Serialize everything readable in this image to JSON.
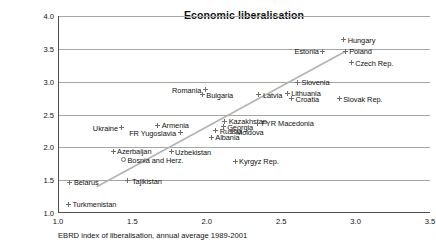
{
  "chart_data": {
    "type": "scatter",
    "title": "Economic liberalisation",
    "xlabel": "EBRD index of liberalisation, annual average 1989-2001",
    "ylabel": "",
    "xlim": [
      1.0,
      3.5
    ],
    "ylim": [
      1.0,
      4.0
    ],
    "xticks": [
      "1.0",
      "1.5",
      "2.0",
      "2.5",
      "3.0",
      "3.5"
    ],
    "yticks": [
      "1.0",
      "1.5",
      "2.0",
      "2.5",
      "3.0",
      "3.5",
      "4.0"
    ],
    "grid": "horizontal",
    "legend": "none",
    "trendline": {
      "x0": 1.26,
      "y0": 1.4,
      "x1": 2.93,
      "y1": 3.46
    },
    "points": [
      {
        "name": "Hungary",
        "x": 2.92,
        "y": 3.64,
        "label_side": "right"
      },
      {
        "name": "Estonia",
        "x": 2.78,
        "y": 3.46,
        "label_side": "left"
      },
      {
        "name": "Poland",
        "x": 2.93,
        "y": 3.46,
        "label_side": "right"
      },
      {
        "name": "Czech Rep.",
        "x": 2.97,
        "y": 3.29,
        "label_side": "right"
      },
      {
        "name": "Slovenia",
        "x": 2.61,
        "y": 2.99,
        "label_side": "right"
      },
      {
        "name": "Lithuania",
        "x": 2.54,
        "y": 2.82,
        "label_side": "right"
      },
      {
        "name": "Latvia",
        "x": 2.35,
        "y": 2.8,
        "label_side": "right"
      },
      {
        "name": "Croatia",
        "x": 2.57,
        "y": 2.74,
        "label_side": "right"
      },
      {
        "name": "Slovak Rep.",
        "x": 2.89,
        "y": 2.74,
        "label_side": "right"
      },
      {
        "name": "Romania",
        "x": 1.99,
        "y": 2.88,
        "label_side": "left"
      },
      {
        "name": "Bulgaria",
        "x": 1.97,
        "y": 2.8,
        "label_side": "right"
      },
      {
        "name": "Kazakhstan",
        "x": 2.12,
        "y": 2.4,
        "label_side": "right"
      },
      {
        "name": "FYR Macedonia",
        "x": 2.34,
        "y": 2.37,
        "label_side": "right"
      },
      {
        "name": "Armenia",
        "x": 1.67,
        "y": 2.34,
        "label_side": "right"
      },
      {
        "name": "Ukraine",
        "x": 1.43,
        "y": 2.3,
        "label_side": "left"
      },
      {
        "name": "Georgia",
        "x": 2.11,
        "y": 2.31,
        "label_side": "right"
      },
      {
        "name": "Russia",
        "x": 2.06,
        "y": 2.25,
        "label_side": "right"
      },
      {
        "name": "Moldova",
        "x": 2.17,
        "y": 2.24,
        "label_side": "right"
      },
      {
        "name": "FR Yugoslavia",
        "x": 1.82,
        "y": 2.22,
        "label_side": "left"
      },
      {
        "name": "Albania",
        "x": 2.03,
        "y": 2.15,
        "label_side": "right"
      },
      {
        "name": "Azerbaijan",
        "x": 1.37,
        "y": 1.94,
        "label_side": "right"
      },
      {
        "name": "Uzbekistan",
        "x": 1.76,
        "y": 1.93,
        "label_side": "right"
      },
      {
        "name": "Bosnia and Herz.",
        "x": 1.44,
        "y": 1.81,
        "label_side": "right",
        "open": true
      },
      {
        "name": "Kyrgyz Rep.",
        "x": 2.19,
        "y": 1.79,
        "label_side": "right"
      },
      {
        "name": "Tajikistan",
        "x": 1.47,
        "y": 1.49,
        "label_side": "right"
      },
      {
        "name": "Belarus",
        "x": 1.08,
        "y": 1.47,
        "label_side": "right"
      },
      {
        "name": "Turkmenistan",
        "x": 1.07,
        "y": 1.13,
        "label_side": "right"
      }
    ]
  }
}
